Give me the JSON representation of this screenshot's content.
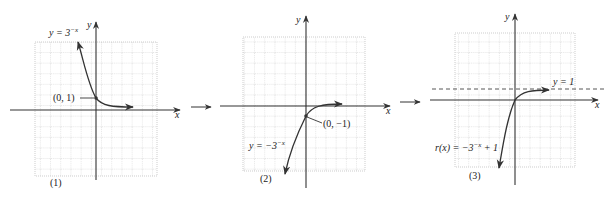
{
  "figure": {
    "panels": [
      {
        "id": "1",
        "caption": "(1)",
        "equation_lhs": "y = 3",
        "equation_exp": "−x",
        "point_label": "(0, 1)",
        "x_axis_label": "x",
        "y_axis_label": "y"
      },
      {
        "id": "2",
        "caption": "(2)",
        "equation_lhs": "y = −3",
        "equation_exp": "−x",
        "point_label": "(0, −1)",
        "x_axis_label": "x",
        "y_axis_label": "y"
      },
      {
        "id": "3",
        "caption": "(3)",
        "equation_lhs": "r(x) = −3",
        "equation_exp": "−x",
        "equation_rhs": " + 1",
        "asymptote_label": "y = 1",
        "x_axis_label": "x",
        "y_axis_label": "y"
      }
    ],
    "colors": {
      "axis": "#333333",
      "curve": "#333333",
      "grid": "#b8b8b8",
      "background": "#ffffff"
    }
  }
}
